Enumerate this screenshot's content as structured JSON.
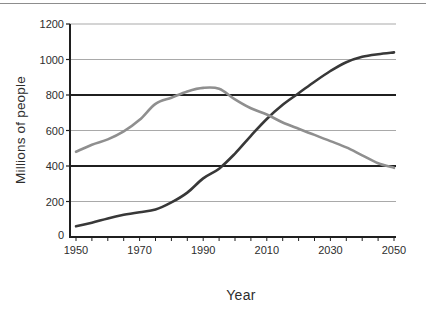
{
  "figure": {
    "background": "#ffffff",
    "top_rule_color": "#8d8d8d"
  },
  "chart_data": {
    "type": "line",
    "title": "",
    "xlabel": "Year",
    "ylabel": "Millions of people",
    "x": [
      1950,
      1955,
      1960,
      1965,
      1970,
      1975,
      1980,
      1985,
      1990,
      1995,
      2000,
      2005,
      2010,
      2015,
      2020,
      2025,
      2030,
      2035,
      2040,
      2045,
      2050
    ],
    "series": [
      {
        "name": "dark-line",
        "color": "#383838",
        "values": [
          60,
          80,
          105,
          125,
          140,
          155,
          195,
          250,
          330,
          385,
          470,
          570,
          665,
          745,
          810,
          875,
          935,
          985,
          1015,
          1030,
          1040
        ]
      },
      {
        "name": "gray-line",
        "color": "#8f8f8f",
        "values": [
          480,
          520,
          550,
          595,
          660,
          750,
          785,
          820,
          840,
          835,
          775,
          725,
          690,
          645,
          610,
          575,
          540,
          505,
          460,
          415,
          390
        ]
      }
    ],
    "xlim": [
      1950,
      2050
    ],
    "ylim": [
      0,
      1200
    ],
    "x_ticks": [
      1950,
      1970,
      1990,
      2010,
      2030,
      2050
    ],
    "x_minor_tick_step": 5,
    "y_ticks": [
      0,
      200,
      400,
      600,
      800,
      1000,
      1200
    ],
    "emphasized_gridlines": [
      400,
      800
    ],
    "grid": true,
    "legend": "none",
    "axis_color": "#1f1f1f",
    "gridline_color": "#a9a9a9",
    "tick_label_color": "#2d2d2d"
  }
}
